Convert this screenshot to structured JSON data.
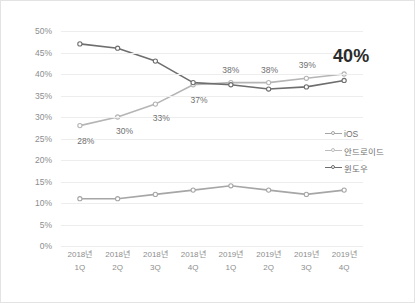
{
  "chart_data": {
    "type": "line",
    "title": "",
    "xlabel": "",
    "ylabel": "",
    "ylim": [
      0,
      50
    ],
    "ytick_labels": [
      "50%",
      "45%",
      "40%",
      "35%",
      "30%",
      "25%",
      "20%",
      "15%",
      "10%",
      "5%",
      "0%"
    ],
    "ytick_values": [
      50,
      45,
      40,
      35,
      30,
      25,
      20,
      15,
      10,
      5,
      0
    ],
    "grid": true,
    "legend_position": "right",
    "categories": [
      {
        "year": "2018년",
        "quarter": "1Q"
      },
      {
        "year": "2018년",
        "quarter": "2Q"
      },
      {
        "year": "2018년",
        "quarter": "3Q"
      },
      {
        "year": "2018년",
        "quarter": "4Q"
      },
      {
        "year": "2019년",
        "quarter": "1Q"
      },
      {
        "year": "2019년",
        "quarter": "2Q"
      },
      {
        "year": "2019년",
        "quarter": "3Q"
      },
      {
        "year": "2019년",
        "quarter": "4Q"
      }
    ],
    "series": [
      {
        "name": "iOS",
        "color": "#a6a6a6",
        "values": [
          11,
          11,
          12,
          13,
          14,
          13,
          12,
          13
        ],
        "labels": [
          "",
          "",
          "",
          "",
          "",
          "",
          "",
          ""
        ]
      },
      {
        "name": "안드로이드",
        "color": "#b5b5b5",
        "values": [
          28,
          30,
          33,
          37.5,
          38,
          38,
          39,
          40
        ],
        "labels": [
          "28%",
          "30%",
          "33%",
          "37%",
          "38%",
          "38%",
          "39%",
          "40%"
        ]
      },
      {
        "name": "윈도우",
        "color": "#6e6e6e",
        "values": [
          47,
          46,
          43,
          38,
          37.5,
          36.5,
          37,
          38.5
        ],
        "labels": [
          "",
          "",
          "",
          "",
          "",
          "",
          "",
          ""
        ]
      }
    ],
    "annotations": [
      {
        "text": "28%",
        "series": "안드로이드",
        "index": 0,
        "emphasis": "normal"
      },
      {
        "text": "30%",
        "series": "안드로이드",
        "index": 1,
        "emphasis": "normal"
      },
      {
        "text": "33%",
        "series": "안드로이드",
        "index": 2,
        "emphasis": "normal"
      },
      {
        "text": "37%",
        "series": "안드로이드",
        "index": 3,
        "emphasis": "normal"
      },
      {
        "text": "38%",
        "series": "안드로이드",
        "index": 4,
        "emphasis": "normal"
      },
      {
        "text": "38%",
        "series": "안드로이드",
        "index": 5,
        "emphasis": "normal"
      },
      {
        "text": "39%",
        "series": "안드로이드",
        "index": 6,
        "emphasis": "normal"
      },
      {
        "text": "40%",
        "series": "안드로이드",
        "index": 7,
        "emphasis": "large"
      }
    ]
  },
  "legend": {
    "items": [
      {
        "label": "iOS",
        "color": "#a6a6a6"
      },
      {
        "label": "안드로이드",
        "color": "#bdbdbd"
      },
      {
        "label": "윈도우",
        "color": "#6e6e6e"
      }
    ]
  },
  "colors": {
    "grid": "#ededed",
    "border": "#e3e3e3",
    "tick_text": "#8d8d8d",
    "label_text": "#6f6f6f",
    "emphasis_text": "#2b2b2b",
    "background": "#ffffff"
  }
}
